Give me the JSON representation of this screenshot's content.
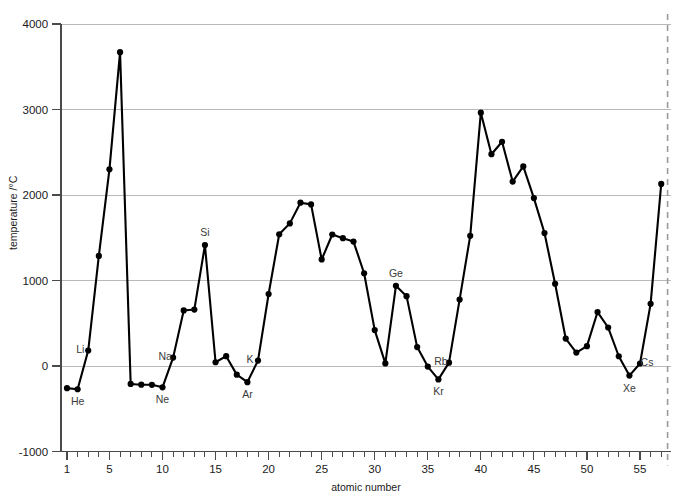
{
  "chart_data": {
    "type": "line",
    "title": "",
    "xlabel": "atomic number",
    "ylabel": "temperature /°C",
    "xlim": [
      0,
      57.8
    ],
    "ylim": [
      -1000,
      4000
    ],
    "grid": "horizontal",
    "legend_position": "none",
    "ytick_labels": [
      "4000",
      "3000",
      "2000",
      "1000",
      "0",
      "-1000"
    ],
    "ytick_values": [
      4000,
      3000,
      2000,
      1000,
      0,
      -1000
    ],
    "xtick_labels": [
      "1",
      "5",
      "10",
      "15",
      "20",
      "25",
      "30",
      "35",
      "40",
      "45",
      "50",
      "55"
    ],
    "xtick_values": [
      1,
      5,
      10,
      15,
      20,
      25,
      30,
      35,
      40,
      45,
      50,
      55
    ],
    "x_minor_tick_step": 1,
    "x": [
      1,
      2,
      3,
      4,
      5,
      6,
      7,
      8,
      9,
      10,
      11,
      12,
      13,
      14,
      15,
      16,
      17,
      18,
      19,
      20,
      21,
      22,
      23,
      24,
      25,
      26,
      27,
      28,
      29,
      30,
      31,
      32,
      33,
      34,
      35,
      36,
      37,
      38,
      39,
      40,
      41,
      42,
      43,
      44,
      45,
      46,
      47,
      48,
      49,
      50,
      51,
      52,
      53,
      54,
      55,
      56,
      57
    ],
    "values": [
      -259,
      -272,
      181,
      1287,
      2300,
      3670,
      -210,
      -219,
      -220,
      -249,
      98,
      650,
      660,
      1414,
      44,
      115,
      -101,
      -189,
      63,
      842,
      1541,
      1668,
      1910,
      1890,
      1246,
      1538,
      1495,
      1455,
      1085,
      420,
      30,
      938,
      817,
      221,
      -7,
      -157,
      39,
      777,
      1522,
      2963,
      2477,
      2623,
      2157,
      2334,
      1964,
      1555,
      962,
      321,
      157,
      232,
      631,
      450,
      114,
      -112,
      29,
      727,
      2130
    ],
    "labelled_points": [
      {
        "x": 2,
        "label": "He",
        "position": "below"
      },
      {
        "x": 3,
        "label": "Li",
        "position": "left"
      },
      {
        "x": 10,
        "label": "Ne",
        "position": "below"
      },
      {
        "x": 11,
        "label": "Na",
        "position": "left"
      },
      {
        "x": 14,
        "label": "Si",
        "position": "above"
      },
      {
        "x": 18,
        "label": "Ar",
        "position": "below"
      },
      {
        "x": 19,
        "label": "K",
        "position": "left"
      },
      {
        "x": 32,
        "label": "Ge",
        "position": "above"
      },
      {
        "x": 36,
        "label": "Kr",
        "position": "below"
      },
      {
        "x": 37,
        "label": "Rb",
        "position": "left"
      },
      {
        "x": 54,
        "label": "Xe",
        "position": "below"
      },
      {
        "x": 55,
        "label": "Cs",
        "position": "right"
      }
    ],
    "cut_line": {
      "x": 57.6,
      "style": "dashed",
      "color": "#9a9a9a"
    },
    "colors": {
      "series": "#000000",
      "gridline": "#b9b9b9",
      "axis": "#4a4a4a",
      "label_text": "#3a3a3a",
      "tick_text": "#1a1a1a"
    }
  }
}
